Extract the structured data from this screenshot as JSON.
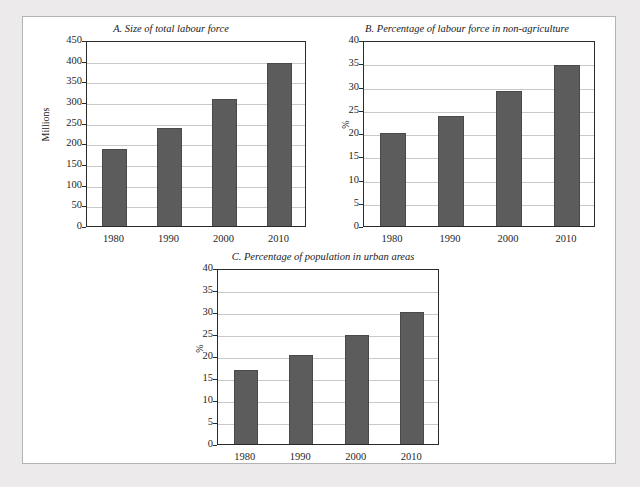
{
  "figure": {
    "background_color": "#eceaea",
    "panel_color": "#ffffff",
    "bar_color": "#5c5c5c",
    "grid_color": "#c9c9c9",
    "axis_color": "#2b2b2b"
  },
  "chart_data": [
    {
      "id": "A",
      "type": "bar",
      "title": "A. Size of total labour force",
      "xlabel": "",
      "ylabel": "Millions",
      "categories": [
        "1980",
        "1990",
        "2000",
        "2010"
      ],
      "values": [
        190,
        242,
        311,
        398
      ],
      "ylim": [
        0,
        450
      ],
      "yticks": [
        0,
        50,
        100,
        150,
        200,
        250,
        300,
        350,
        400,
        450
      ],
      "ytick_labels": [
        "0",
        "50",
        "100",
        "150",
        "200",
        "250",
        "300",
        "350",
        "400",
        "450"
      ],
      "grid": true,
      "legend": "none"
    },
    {
      "id": "B",
      "type": "bar",
      "title": "B. Percentage of labour force in non-agriculture",
      "xlabel": "",
      "ylabel": "%",
      "categories": [
        "1980",
        "1990",
        "2000",
        "2010"
      ],
      "values": [
        20.5,
        24.1,
        29.4,
        35.1
      ],
      "ylim": [
        0,
        40
      ],
      "yticks": [
        0,
        5,
        10,
        15,
        20,
        25,
        30,
        35,
        40
      ],
      "ytick_labels": [
        "0",
        "5",
        "10",
        "15",
        "20",
        "25",
        "30",
        "35",
        "40"
      ],
      "grid": true,
      "legend": "none"
    },
    {
      "id": "C",
      "type": "bar",
      "title": "C. Percentage of population in urban areas",
      "xlabel": "",
      "ylabel": "%",
      "categories": [
        "1980",
        "1990",
        "2000",
        "2010"
      ],
      "values": [
        17.3,
        20.7,
        25.2,
        30.5
      ],
      "ylim": [
        0,
        40
      ],
      "yticks": [
        0,
        5,
        10,
        15,
        20,
        25,
        30,
        35,
        40
      ],
      "ytick_labels": [
        "0",
        "5",
        "10",
        "15",
        "20",
        "25",
        "30",
        "35",
        "40"
      ],
      "grid": true,
      "legend": "none"
    }
  ]
}
